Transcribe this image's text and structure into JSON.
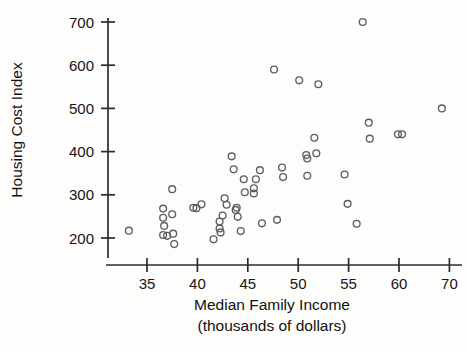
{
  "chart_data": {
    "type": "scatter",
    "title": "",
    "xlabel": "Median Family Income",
    "xlabel_line2": "(thousands of dollars)",
    "ylabel": "Housing Cost Index",
    "x_ticks": [
      35,
      40,
      45,
      50,
      55,
      60,
      70
    ],
    "x_tick_labels": [
      "35",
      "40",
      "45",
      "50",
      "55",
      "60",
      "70"
    ],
    "y_ticks": [
      200,
      300,
      400,
      500,
      600,
      700
    ],
    "y_tick_labels": [
      "200",
      "300",
      "400",
      "500",
      "600",
      "700"
    ],
    "xlim": [
      32,
      71
    ],
    "ylim": [
      160,
      720
    ],
    "grid": false,
    "legend": false,
    "marker_style": "open-circle",
    "marker_color": "#5d5d66",
    "axis_color": "#2b2b2b",
    "axis_note": "x-axis tick spacing is uniform between 35,40,45,50,55,60 and 70 (axis is broken between 60 and 70)",
    "points": [
      {
        "x": 33.2,
        "y": 217
      },
      {
        "x": 36.6,
        "y": 268
      },
      {
        "x": 36.6,
        "y": 247
      },
      {
        "x": 36.7,
        "y": 228
      },
      {
        "x": 36.6,
        "y": 207
      },
      {
        "x": 37.0,
        "y": 205
      },
      {
        "x": 37.5,
        "y": 313
      },
      {
        "x": 37.5,
        "y": 255
      },
      {
        "x": 37.6,
        "y": 210
      },
      {
        "x": 37.7,
        "y": 186
      },
      {
        "x": 39.6,
        "y": 270
      },
      {
        "x": 39.9,
        "y": 269
      },
      {
        "x": 40.4,
        "y": 278
      },
      {
        "x": 41.6,
        "y": 197
      },
      {
        "x": 42.2,
        "y": 222
      },
      {
        "x": 42.2,
        "y": 238
      },
      {
        "x": 42.3,
        "y": 213
      },
      {
        "x": 42.5,
        "y": 252
      },
      {
        "x": 42.7,
        "y": 292
      },
      {
        "x": 42.9,
        "y": 277
      },
      {
        "x": 43.4,
        "y": 389
      },
      {
        "x": 43.6,
        "y": 359
      },
      {
        "x": 43.8,
        "y": 265
      },
      {
        "x": 43.9,
        "y": 270
      },
      {
        "x": 44.0,
        "y": 249
      },
      {
        "x": 44.3,
        "y": 216
      },
      {
        "x": 44.6,
        "y": 336
      },
      {
        "x": 44.7,
        "y": 306
      },
      {
        "x": 45.6,
        "y": 315
      },
      {
        "x": 45.6,
        "y": 303
      },
      {
        "x": 45.8,
        "y": 336
      },
      {
        "x": 46.2,
        "y": 357
      },
      {
        "x": 46.4,
        "y": 234
      },
      {
        "x": 47.6,
        "y": 590
      },
      {
        "x": 47.9,
        "y": 242
      },
      {
        "x": 48.4,
        "y": 363
      },
      {
        "x": 48.5,
        "y": 341
      },
      {
        "x": 50.1,
        "y": 565
      },
      {
        "x": 50.8,
        "y": 392
      },
      {
        "x": 50.9,
        "y": 384
      },
      {
        "x": 50.9,
        "y": 344
      },
      {
        "x": 51.6,
        "y": 432
      },
      {
        "x": 51.8,
        "y": 396
      },
      {
        "x": 52.0,
        "y": 556
      },
      {
        "x": 54.6,
        "y": 347
      },
      {
        "x": 54.9,
        "y": 279
      },
      {
        "x": 55.8,
        "y": 233
      },
      {
        "x": 56.4,
        "y": 700
      },
      {
        "x": 57.0,
        "y": 467
      },
      {
        "x": 57.1,
        "y": 430
      },
      {
        "x": 59.9,
        "y": 440
      },
      {
        "x": 60.6,
        "y": 440
      },
      {
        "x": 68.5,
        "y": 500
      }
    ]
  }
}
